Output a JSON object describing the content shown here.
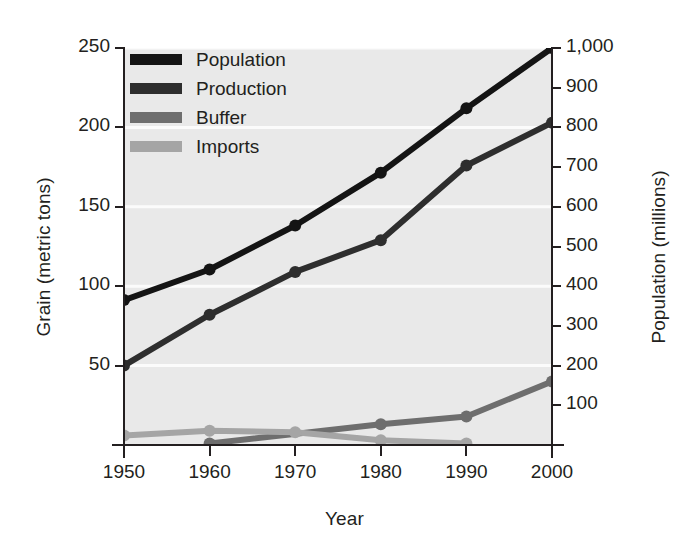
{
  "chart_data": {
    "type": "line",
    "title": "",
    "xlabel": "Year",
    "ylabel": "Grain (metric tons)",
    "ylabel_right": "Population (millions)",
    "x": [
      1950,
      1960,
      1970,
      1980,
      1990,
      2000
    ],
    "xtick_labels": [
      "1950",
      "1960",
      "1970",
      "1980",
      "1990",
      "2000"
    ],
    "xlim": [
      1950,
      2000
    ],
    "ylim": [
      0,
      250
    ],
    "ytick_values": [
      50,
      100,
      150,
      200,
      250
    ],
    "ytick_labels": [
      "50",
      "100",
      "150",
      "200",
      "250"
    ],
    "ylim_right": [
      0,
      1000
    ],
    "ytick_values_right": [
      100,
      200,
      300,
      400,
      500,
      600,
      700,
      800,
      900,
      1000
    ],
    "ytick_labels_right": [
      "100",
      "200",
      "300",
      "400",
      "500",
      "600",
      "700",
      "800",
      "900",
      "1,000"
    ],
    "grid": true,
    "grid_color": "#fbfbfb",
    "legend_position": "top-left",
    "plot_background": "#e9e9e9",
    "series": [
      {
        "name": "Population",
        "axis": "right",
        "color": "#141414",
        "values_right": [
          365,
          442,
          553,
          686,
          848,
          1000
        ],
        "values": [
          91,
          110,
          138,
          171,
          212,
          250
        ]
      },
      {
        "name": "Production",
        "axis": "left",
        "color": "#2e2e2e",
        "values": [
          50,
          82,
          109,
          129,
          176,
          203
        ]
      },
      {
        "name": "Buffer",
        "axis": "left",
        "color": "#6e6e6e",
        "values": [
          null,
          1,
          null,
          13,
          18,
          40
        ]
      },
      {
        "name": "Imports",
        "axis": "left",
        "color": "#a5a5a5",
        "values": [
          6,
          9,
          8,
          3,
          1,
          null
        ]
      }
    ]
  },
  "legend": {
    "items": [
      {
        "label": "Population",
        "color": "#141414"
      },
      {
        "label": "Production",
        "color": "#2e2e2e"
      },
      {
        "label": "Buffer",
        "color": "#6e6e6e"
      },
      {
        "label": "Imports",
        "color": "#a5a5a5"
      }
    ]
  },
  "axes": {
    "left_title": "Grain (metric tons)",
    "right_title": "Population (millions)",
    "bottom_title": "Year"
  }
}
